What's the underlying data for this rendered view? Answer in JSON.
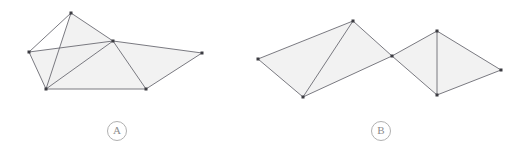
{
  "canvas": {
    "width": 527,
    "height": 146,
    "background": "#ffffff"
  },
  "style": {
    "edge_color": "#6b6b73",
    "edge_width": 0.9,
    "fill_color": "#f0f0f0",
    "fill_opacity": 0.85,
    "vertex_color": "#3c3c42",
    "vertex_size": 3,
    "label_color": "#8c8c8c",
    "label_border_color": "#b0b0b0"
  },
  "figures": [
    {
      "id": "figure-a",
      "label": "A",
      "label_position": {
        "x": 116,
        "y": 130
      },
      "description": "polygon mesh with five triangular faces sharing a central hub",
      "vertices": [
        {
          "name": "left",
          "x": 29,
          "y": 52
        },
        {
          "name": "top",
          "x": 71,
          "y": 13
        },
        {
          "name": "center",
          "x": 113,
          "y": 41
        },
        {
          "name": "right",
          "x": 202,
          "y": 53
        },
        {
          "name": "bottom-left",
          "x": 46,
          "y": 89
        },
        {
          "name": "bottom-right",
          "x": 146,
          "y": 89
        }
      ],
      "faces": [
        {
          "name": "face-left-wing",
          "vertices": [
            0,
            4,
            2
          ]
        },
        {
          "name": "face-top-spike",
          "vertices": [
            1,
            2,
            4
          ]
        },
        {
          "name": "face-lower-left",
          "vertices": [
            4,
            5,
            2
          ]
        },
        {
          "name": "face-right-wing",
          "vertices": [
            2,
            3,
            5
          ]
        }
      ],
      "edges": [
        {
          "from": 0,
          "to": 1
        },
        {
          "from": 0,
          "to": 2
        },
        {
          "from": 0,
          "to": 4
        },
        {
          "from": 1,
          "to": 2
        },
        {
          "from": 1,
          "to": 4
        },
        {
          "from": 2,
          "to": 3
        },
        {
          "from": 2,
          "to": 4
        },
        {
          "from": 2,
          "to": 5
        },
        {
          "from": 3,
          "to": 5
        },
        {
          "from": 4,
          "to": 5
        }
      ]
    },
    {
      "id": "figure-b",
      "label": "B",
      "label_position": {
        "x": 380,
        "y": 130
      },
      "description": "two quadrilateral wings meeting at a central point, zig-zag folded strip",
      "vertices": [
        {
          "name": "far-left",
          "x": 258,
          "y": 59
        },
        {
          "name": "peak-left",
          "x": 353,
          "y": 21
        },
        {
          "name": "bottom-left",
          "x": 303,
          "y": 97
        },
        {
          "name": "center",
          "x": 392,
          "y": 56
        },
        {
          "name": "peak-right",
          "x": 437,
          "y": 31
        },
        {
          "name": "bottom-right",
          "x": 437,
          "y": 95
        },
        {
          "name": "far-right",
          "x": 501,
          "y": 70
        }
      ],
      "faces": [
        {
          "name": "face-left-quad",
          "vertices": [
            0,
            1,
            3,
            2
          ]
        },
        {
          "name": "face-right-quad",
          "vertices": [
            3,
            4,
            6,
            5
          ]
        }
      ],
      "edges": [
        {
          "from": 0,
          "to": 1
        },
        {
          "from": 0,
          "to": 2
        },
        {
          "from": 1,
          "to": 2
        },
        {
          "from": 1,
          "to": 3
        },
        {
          "from": 2,
          "to": 3
        },
        {
          "from": 3,
          "to": 4
        },
        {
          "from": 3,
          "to": 5
        },
        {
          "from": 4,
          "to": 5
        },
        {
          "from": 4,
          "to": 6
        },
        {
          "from": 5,
          "to": 6
        }
      ]
    }
  ]
}
